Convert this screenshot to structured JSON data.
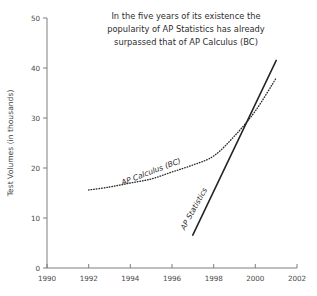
{
  "chart_data": {
    "type": "line",
    "title": "In the five years of its existence the popularity of AP Statistics has already surpassed that of AP Calculus (BC)",
    "title_lines": [
      "In the five years of its existence the",
      "popularity of AP Statistics has already",
      "surpassed that of AP Calculus (BC)"
    ],
    "xlabel": "",
    "ylabel": "Test Volumes (in thousands)",
    "xlim": [
      1990,
      2002
    ],
    "ylim": [
      0,
      50
    ],
    "xticks": [
      1990,
      1992,
      1994,
      1996,
      1998,
      2000,
      2002
    ],
    "yticks": [
      0,
      10,
      20,
      30,
      40,
      50
    ],
    "xtick_labels": [
      "1990",
      "1992",
      "1994",
      "1996",
      "1998",
      "2000",
      "2002"
    ],
    "ytick_labels": [
      "0",
      "10",
      "20",
      "30",
      "40",
      "50"
    ],
    "grid": false,
    "legend": "inline-labels",
    "series": [
      {
        "name": "AP Calculus (BC)",
        "style": "dotted",
        "label_angle": -21,
        "x": [
          1992,
          1993,
          1994,
          1995,
          1996,
          1997,
          1998,
          1999,
          2000,
          2001
        ],
        "values": [
          15.6,
          16.2,
          17.0,
          17.8,
          19.2,
          20.6,
          22.4,
          26.4,
          31.4,
          38.0
        ]
      },
      {
        "name": "AP Statistics",
        "style": "solid",
        "label_angle": -61,
        "x": [
          1997,
          2001
        ],
        "values": [
          6.6,
          41.5
        ]
      }
    ]
  },
  "axis": {
    "y_title": "Test Volumes (in thousands)"
  }
}
